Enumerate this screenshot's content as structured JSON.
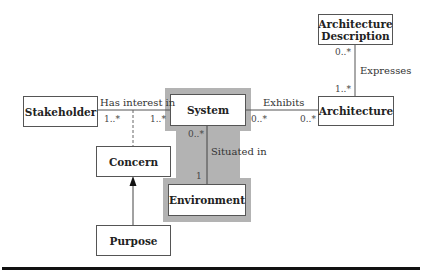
{
  "diagram": {
    "type": "uml-class-diagram",
    "highlight_color": "#b3b3b3",
    "nodes": {
      "stakeholder": {
        "label": "Stakeholder"
      },
      "system": {
        "label": "System"
      },
      "architecture": {
        "label": "Architecture"
      },
      "architecture_description": {
        "label_line1": "Architecture",
        "label_line2": "Description"
      },
      "concern": {
        "label": "Concern"
      },
      "environment": {
        "label": "Environment"
      },
      "purpose": {
        "label": "Purpose"
      }
    },
    "edges": {
      "has_interest_in": {
        "label": "Has interest in",
        "source": "Stakeholder",
        "target": "System",
        "source_mult": "1..*",
        "target_mult": "1..*"
      },
      "exhibits": {
        "label": "Exhibits",
        "source": "System",
        "target": "Architecture",
        "source_mult": "0..*",
        "target_mult": "0..*"
      },
      "expresses": {
        "label": "Expresses",
        "source": "Architecture Description",
        "target": "Architecture",
        "source_mult": "0..*",
        "target_mult": "1..*"
      },
      "situated_in": {
        "label": "Situated in",
        "source": "System",
        "target": "Environment",
        "source_mult": "0..*",
        "target_mult": "1"
      },
      "association_class": {
        "source": "Concern",
        "target": "Has interest in",
        "style": "dashed"
      },
      "generalization": {
        "source": "Purpose",
        "target": "Concern",
        "style": "arrow"
      }
    }
  }
}
